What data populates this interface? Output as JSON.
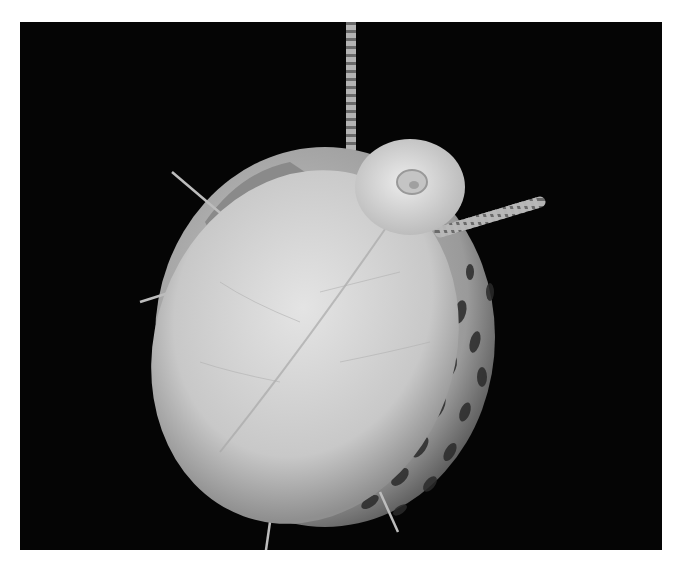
{
  "image": {
    "subject": "snail",
    "style": "grayscale microscope photograph",
    "background_color": "#050505",
    "border_color": "#ffffff",
    "colors": {
      "foot": "#c8c8c8",
      "foot_highlight": "#e2e2e2",
      "shell": "#a9a9a9",
      "shell_spots": "#2a2a2a",
      "tentacle": "#9a9a9a",
      "head": "#d8d8d8"
    }
  }
}
